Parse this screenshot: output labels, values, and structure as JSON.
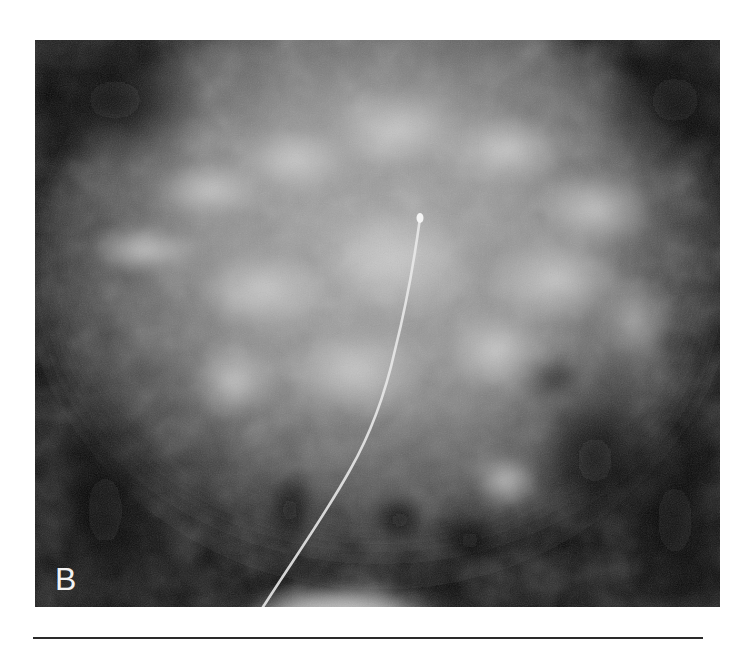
{
  "figure": {
    "panel_label": "B",
    "image_type": "abdominal-radiograph",
    "colors": {
      "background": "#050505",
      "tissue_mid": "#8a8a8a",
      "tissue_bright": "#c8c8c8",
      "catheter": "#e6e6e6",
      "page": "#ffffff",
      "rule": "#2a2a2a"
    }
  }
}
